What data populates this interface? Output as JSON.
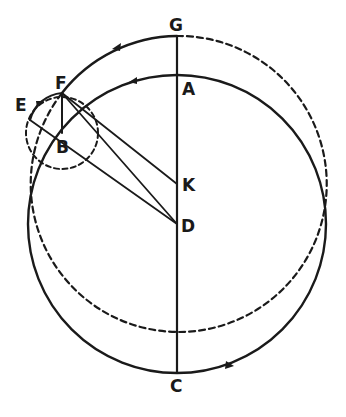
{
  "diagram": {
    "type": "geometric construction",
    "stroke_color": "#1a1a1a",
    "background": "#ffffff",
    "labels": {
      "G": "G",
      "A": "A",
      "F": "F",
      "E": "E",
      "B": "B",
      "K": "K",
      "D": "D",
      "C": "C"
    },
    "elements": [
      "solid circle centered at D through A and C",
      "circle centered at K through G and F (solid arc G to F, dashed elsewhere)",
      "small dashed circle centered at B",
      "vertical line G–C through A, K, D",
      "line E–B–D",
      "line F–D",
      "line F–K",
      "line F–B",
      "solid arc E–F with arrow",
      "direction arrows on arcs"
    ]
  }
}
